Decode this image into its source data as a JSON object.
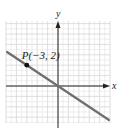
{
  "chart_data": {
    "type": "line",
    "title": "",
    "xlabel": "x",
    "ylabel": "y",
    "grid": true,
    "xlim": [
      -5,
      5
    ],
    "ylim": [
      -3.5,
      6.2
    ],
    "series": [
      {
        "name": "line through origin and P",
        "equation": "y = -2/3 x",
        "x": [
          -5,
          5
        ],
        "y": [
          3.33,
          -3.33
        ]
      }
    ],
    "points": [
      {
        "label": "P(−3, 2)",
        "x": -3,
        "y": 2
      }
    ]
  },
  "labels": {
    "x_axis": "x",
    "y_axis": "y",
    "point": "P(−3, 2)"
  },
  "colors": {
    "grid": "#d6d6d6",
    "axis": "#222222",
    "line": "#6e6e6e",
    "point": "#111111"
  }
}
